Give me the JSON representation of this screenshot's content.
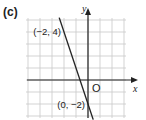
{
  "part_label": "(c)",
  "chart_data": {
    "type": "line",
    "title": "",
    "xlabel": "x",
    "ylabel": "y",
    "origin_label": "O",
    "xlim": [
      -5,
      3
    ],
    "ylim": [
      -3,
      5
    ],
    "grid": true,
    "series": [
      {
        "name": "line",
        "points": [
          [
            -2,
            4
          ],
          [
            0,
            -2
          ]
        ],
        "slope": -3,
        "intercept": -2
      }
    ],
    "annotations": [
      {
        "text": "(−2, 4)",
        "x": -2,
        "y": 4
      },
      {
        "text": "(0, −2)",
        "x": 0,
        "y": -2
      }
    ],
    "colors": {
      "grid": "#c8c8c8",
      "axis": "#222222",
      "line": "#222222"
    }
  }
}
